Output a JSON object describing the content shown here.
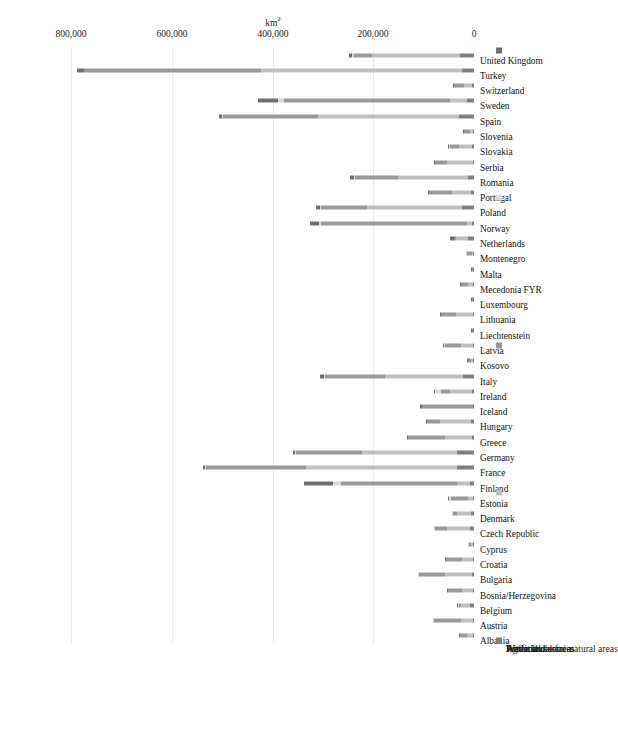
{
  "chart_data": {
    "type": "bar",
    "subtype": "stacked-bar",
    "orientation": "vertical-rotated-90ccw",
    "title": "",
    "xlabel": "",
    "ylabel": "km²",
    "ylim": [
      0,
      870000
    ],
    "grid": true,
    "legend_position": "bottom",
    "ticks": [
      "0",
      "200,000",
      "400,000",
      "600,000",
      "800,000"
    ],
    "tick_values": [
      0,
      200000,
      400000,
      600000,
      800000
    ],
    "unit_label": "km",
    "unit_exponent": "2",
    "categories": [
      "Albania",
      "Austria",
      "Belgium",
      "Bosnia/Herzegovina",
      "Bulgaria",
      "Croatia",
      "Cyprus",
      "Czech Republic",
      "Denmark",
      "Estonia",
      "Finland",
      "France",
      "Germany",
      "Greece",
      "Hungary",
      "Iceland",
      "Ireland",
      "Italy",
      "Kosovo",
      "Latvia",
      "Liechtenstein",
      "Lithuania",
      "Luxembourg",
      "Mecedonia FYR",
      "Malta",
      "Montenegro",
      "Netherlands",
      "Norway",
      "Poland",
      "Portugal",
      "Romania",
      "Serbia",
      "Slovakia",
      "Slovenia",
      "Spain",
      "Sweden",
      "Switzerland",
      "Turkey",
      "United Kingdom"
    ],
    "series": [
      {
        "name": "Artificial surfaces",
        "color": "#808080",
        "values": [
          900,
          2700,
          7500,
          2200,
          3900,
          2400,
          700,
          7700,
          6200,
          1900,
          7500,
          33000,
          33000,
          4700,
          6800,
          300,
          3200,
          22000,
          600,
          2200,
          20,
          2700,
          400,
          800,
          70,
          300,
          12000,
          3500,
          23000,
          6000,
          11000,
          3000,
          4700,
          1200,
          29000,
          13000,
          4000,
          24000,
          28000
        ]
      },
      {
        "name": "Agricultural areas",
        "color": "#bfbfbf",
        "values": [
          12000,
          24000,
          18000,
          22000,
          53000,
          22000,
          3900,
          45000,
          28000,
          11000,
          27000,
          300000,
          190000,
          53000,
          61000,
          1400,
          45000,
          155000,
          5800,
          24000,
          60,
          33000,
          1300,
          11000,
          140,
          3000,
          24000,
          11000,
          190000,
          37000,
          140000,
          50000,
          26000,
          6000,
          280000,
          34000,
          15000,
          400000,
          175000
        ]
      },
      {
        "name": "Forest and semi-natural areas",
        "color": "#999999",
        "values": [
          14000,
          53000,
          5000,
          27000,
          53000,
          31000,
          5000,
          25000,
          8000,
          32000,
          230000,
          200000,
          130000,
          73000,
          25000,
          100000,
          18000,
          120000,
          4400,
          32000,
          100,
          29000,
          900,
          13000,
          80,
          10000,
          3000,
          290000,
          90000,
          46000,
          85000,
          24000,
          18000,
          12000,
          190000,
          330000,
          20000,
          350000,
          35000
        ]
      },
      {
        "name": "Wetlands",
        "color": "#d9d9d9",
        "values": [
          200,
          200,
          100,
          100,
          200,
          300,
          30,
          300,
          600,
          4000,
          15000,
          2000,
          2000,
          300,
          200,
          1300,
          12000,
          600,
          20,
          500,
          5,
          1000,
          20,
          30,
          5,
          30,
          800,
          3500,
          2500,
          300,
          3000,
          200,
          100,
          50,
          900,
          12000,
          200,
          900,
          4500
        ]
      },
      {
        "name": "Water bodies",
        "color": "#6e6e6e",
        "values": [
          1300,
          500,
          400,
          600,
          1200,
          600,
          60,
          1300,
          700,
          2300,
          58000,
          3500,
          5000,
          1400,
          1500,
          2800,
          1200,
          7000,
          100,
          2000,
          10,
          2500,
          40,
          500,
          5,
          200,
          7500,
          17000,
          8000,
          1400,
          8000,
          1500,
          500,
          200,
          6000,
          40000,
          1400,
          13000,
          6500
        ]
      }
    ]
  },
  "legend": {
    "items": [
      {
        "label": "Artificial surfaces",
        "color": "#808080"
      },
      {
        "label": "Agricultural areas",
        "color": "#bfbfbf"
      },
      {
        "label": "Forest and semi-natural areas",
        "color": "#999999"
      },
      {
        "label": "Wetlands",
        "color": "#d9d9d9"
      },
      {
        "label": "Water bodies",
        "color": "#6e6e6e"
      }
    ]
  }
}
